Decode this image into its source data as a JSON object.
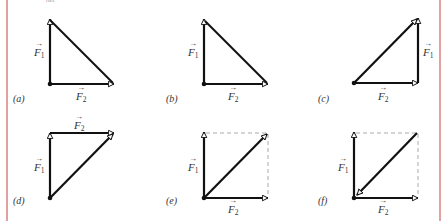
{
  "header_fragment": "net",
  "colors": {
    "stroke": "#111111",
    "dashed": "#aaaaaa",
    "label": "#333333",
    "page_rule": "#e3a0a0"
  },
  "vectors": {
    "f1": {
      "symbol": "F",
      "subscript": "1"
    },
    "f2": {
      "symbol": "F",
      "subscript": "2"
    }
  },
  "panels": [
    {
      "id": "a",
      "label": "(a)",
      "description": "F1 up and F2 right from common tail; hypotenuse from head of F1 to head of F2"
    },
    {
      "id": "b",
      "label": "(b)",
      "description": "F1 up and F2 right from common tail; hypotenuse line joining heads"
    },
    {
      "id": "c",
      "label": "(c)",
      "description": "F2 right, then F1 up from head of F2 (head-to-tail); resultant from origin to head of F1"
    },
    {
      "id": "d",
      "label": "(d)",
      "description": "F1 up, then F2 right from head of F1 (head-to-tail); resultant from origin to head of F2"
    },
    {
      "id": "e",
      "label": "(e)",
      "description": "Parallelogram: F1 up, F2 right, dashed completion, diagonal arrow from origin outward"
    },
    {
      "id": "f",
      "label": "(f)",
      "description": "Parallelogram: F1 up, F2 right, dashed completion, diagonal arrow pointing toward origin"
    }
  ]
}
